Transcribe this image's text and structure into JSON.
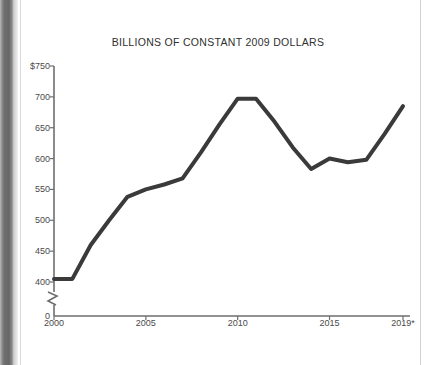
{
  "chart_data": {
    "type": "line",
    "title": "BILLIONS OF CONSTANT 2009 DOLLARS",
    "xlabel": "",
    "ylabel": "",
    "x": [
      2000,
      2001,
      2002,
      2003,
      2004,
      2005,
      2006,
      2007,
      2008,
      2009,
      2010,
      2011,
      2012,
      2013,
      2014,
      2015,
      2016,
      2017,
      2018,
      2019
    ],
    "values": [
      405,
      405,
      460,
      500,
      538,
      550,
      558,
      568,
      610,
      655,
      697,
      697,
      660,
      618,
      583,
      600,
      594,
      598,
      640,
      685
    ],
    "series": [
      {
        "name": "Constant 2009 dollars",
        "values": [
          405,
          405,
          460,
          500,
          538,
          550,
          558,
          568,
          610,
          655,
          697,
          697,
          660,
          618,
          583,
          600,
          594,
          598,
          640,
          685
        ]
      }
    ],
    "ylim": [
      400,
      750
    ],
    "xlim": [
      2000,
      2019
    ],
    "y_ticks": [
      400,
      450,
      500,
      550,
      600,
      650,
      700,
      750
    ],
    "y_tick_labels": [
      "400",
      "450",
      "500",
      "550",
      "600",
      "650",
      "700",
      "$750"
    ],
    "zero_tick_label": "0",
    "axis_break": true,
    "x_ticks": [
      2000,
      2005,
      2010,
      2015,
      2019
    ],
    "x_tick_labels": [
      "2000",
      "2005",
      "2010",
      "2015",
      "2019*"
    ],
    "grid": false,
    "legend": "none",
    "line_color": "#3a3a3a",
    "line_width": 4,
    "axis_color": "#6e6e6e",
    "background_color": "#ffffff"
  }
}
